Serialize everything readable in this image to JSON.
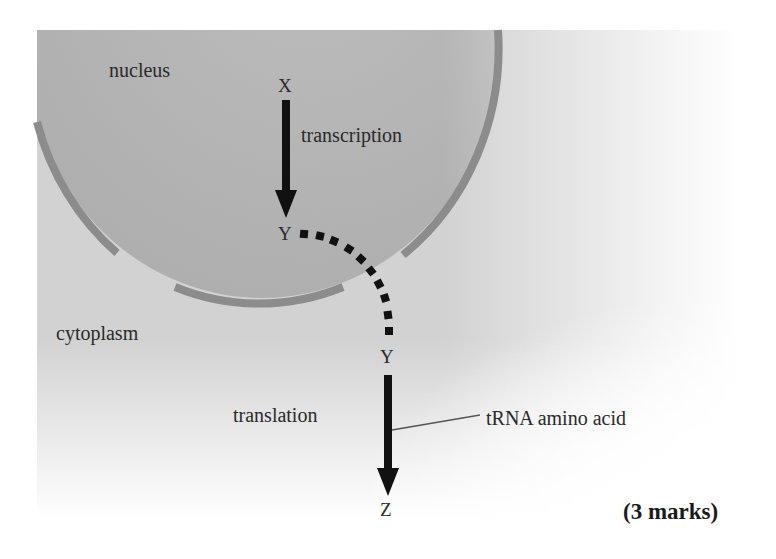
{
  "diagram": {
    "regions": {
      "nucleus": "nucleus",
      "cytoplasm": "cytoplasm"
    },
    "processes": {
      "transcription": "transcription",
      "translation": "translation"
    },
    "molecules": {
      "start": "X",
      "intermediate_in_nucleus": "Y",
      "intermediate_in_cytoplasm": "Y",
      "product": "Z"
    },
    "callout": "tRNA amino acid",
    "marks": "(3 marks)",
    "colors": {
      "cytoplasm": "#d2d2d2",
      "nucleus": "#b5b5b5",
      "membrane": "#8c8c8c",
      "arrow": "#111111",
      "text": "#2a2a2a"
    }
  }
}
